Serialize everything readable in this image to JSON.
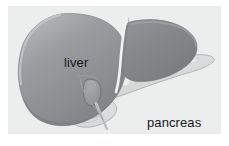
{
  "figure": {
    "kind": "anatomical-illustration",
    "style": "grayscale medical diagram",
    "background_color": "#eceded",
    "frame_color": "#ffffff",
    "label_color": "#15181a"
  },
  "labels": {
    "liver": "liver",
    "pancreas": "pancreas"
  },
  "structures": {
    "liver_right_lobe": {
      "name": "liver right lobe",
      "fill": "#8f9294",
      "edge_highlight": "#b9bcbd"
    },
    "liver_left_lobe": {
      "name": "liver left lobe",
      "fill": "#7e8284"
    },
    "falciform_ligament": {
      "name": "falciform ligament",
      "stroke": "#f2f3f3"
    },
    "gallbladder": {
      "name": "gallbladder",
      "fill": "#9a9d9f",
      "stroke": "#6f7375"
    },
    "bile_duct": {
      "name": "common bile duct",
      "stroke": "#b6b9ba"
    },
    "pancreas_body": {
      "name": "pancreas",
      "fill": "#dcdede",
      "stroke": "#b4b7b8"
    },
    "duodenum": {
      "name": "duodenum",
      "fill": "#e2e4e4",
      "stroke": "#b4b7b8"
    }
  }
}
